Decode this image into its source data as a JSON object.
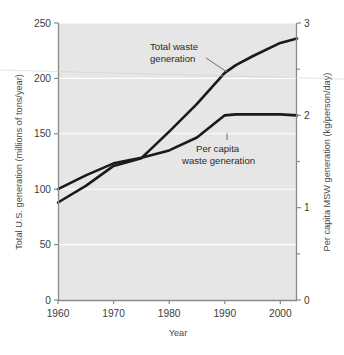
{
  "chart_data": {
    "type": "line",
    "title": "",
    "xlabel": "Year",
    "ylabel": "Total U.S. generation (millions of tons/year)",
    "y2label": "Per capita MSW generation (kg/person/day)",
    "xlim": [
      1960,
      2003
    ],
    "ylim": [
      0,
      250
    ],
    "y2lim": [
      0,
      3
    ],
    "grid": true,
    "grid_color": "#ffffff",
    "plot_background": "#e6e6e6",
    "line_color": "#1a1a1a",
    "legend": "annotations",
    "xticks": [
      "1960",
      "1970",
      "1980",
      "1990",
      "2000"
    ],
    "xtick_values": [
      1960,
      1970,
      1980,
      1990,
      2000
    ],
    "yticks": [
      "0",
      "50",
      "100",
      "150",
      "200",
      "250"
    ],
    "ytick_values": [
      0,
      50,
      100,
      150,
      200,
      250
    ],
    "y2ticks": [
      "0",
      "1",
      "2",
      "3"
    ],
    "y2tick_values": [
      0,
      1,
      2,
      3
    ],
    "y2_minor_ticks": [
      0.5,
      1.5,
      2.5
    ],
    "series": [
      {
        "name": "Total waste generation",
        "axis": "left",
        "units": "millions of tons/year",
        "x": [
          1960,
          1965,
          1970,
          1975,
          1980,
          1985,
          1990,
          1992,
          1995,
          2000,
          2003
        ],
        "values": [
          88,
          103,
          121,
          128,
          152,
          177,
          205,
          212,
          220,
          232,
          236
        ]
      },
      {
        "name": "Per capita waste generation",
        "axis": "right",
        "units": "kg/person/day",
        "x": [
          1960,
          1965,
          1970,
          1975,
          1980,
          1985,
          1990,
          1992,
          1995,
          2000,
          2003
        ],
        "values": [
          1.2,
          1.35,
          1.48,
          1.54,
          1.62,
          1.76,
          2.0,
          2.01,
          2.01,
          2.01,
          2.0
        ],
        "values_left_scale": [
          100,
          112,
          123,
          128,
          135,
          147,
          167,
          167.5,
          167.5,
          167.5,
          167
        ]
      }
    ],
    "annotations": [
      {
        "id": "total-waste-annotation",
        "lines": [
          "Total waste",
          "generation"
        ],
        "points_to_series": "Total waste generation",
        "points_to_year": 1991
      },
      {
        "id": "per-capita-annotation",
        "lines": [
          "Per capita",
          "waste generation"
        ],
        "points_to_series": "Per capita waste generation",
        "points_to_year": 1992
      }
    ]
  },
  "axes": {
    "left_title": "Total U.S. generation (millions of tons/year)",
    "right_title": "Per capita MSW generation (kg/person/day)",
    "bottom_title": "Year"
  },
  "annotations": {
    "total_line1": "Total waste",
    "total_line2": "generation",
    "percapita_line1": "Per capita",
    "percapita_line2": "waste generation"
  }
}
